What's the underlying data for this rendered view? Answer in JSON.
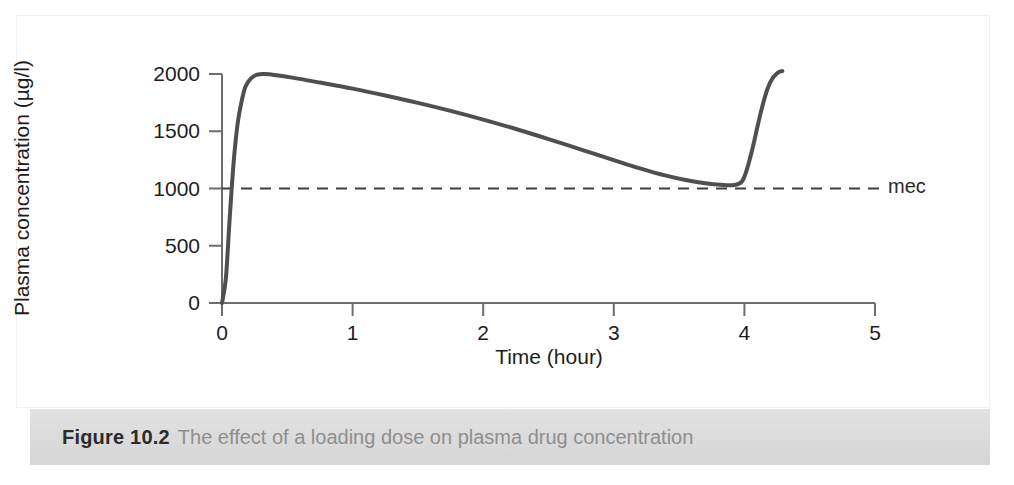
{
  "figure": {
    "caption_number": "Figure 10.2",
    "caption_text": "The effect of a loading dose on plasma drug concentration"
  },
  "chart_data": {
    "type": "line",
    "title": "",
    "xlabel": "Time (hour)",
    "ylabel": "Plasma concentration (µg/l)",
    "xlim": [
      0,
      5
    ],
    "ylim": [
      0,
      2000
    ],
    "xticks": [
      "0",
      "1",
      "2",
      "3",
      "4",
      "5"
    ],
    "xtick_values": [
      0,
      1,
      2,
      3,
      4,
      5
    ],
    "yticks": [
      "0",
      "500",
      "1000",
      "1500",
      "2000"
    ],
    "ytick_values": [
      0,
      500,
      1000,
      1500,
      2000
    ],
    "grid": false,
    "legend": "none",
    "line_color": "#4f4f4f",
    "axis_color": "#6d6d6d",
    "annotations": [
      {
        "name": "mec",
        "label": "mec",
        "type": "horizontal-threshold-line",
        "value": 1000,
        "style": "dashed",
        "color": "#3d3d3d",
        "x_start": 0,
        "x_end": 5.0
      }
    ],
    "series": [
      {
        "name": "plasma concentration",
        "points": [
          [
            0.0,
            0
          ],
          [
            0.03,
            220
          ],
          [
            0.06,
            760
          ],
          [
            0.09,
            1240
          ],
          [
            0.12,
            1570
          ],
          [
            0.15,
            1760
          ],
          [
            0.18,
            1890
          ],
          [
            0.22,
            1960
          ],
          [
            0.27,
            1995
          ],
          [
            0.33,
            2000
          ],
          [
            0.4,
            1992
          ],
          [
            0.55,
            1966
          ],
          [
            0.75,
            1925
          ],
          [
            1.0,
            1872
          ],
          [
            1.25,
            1812
          ],
          [
            1.5,
            1748
          ],
          [
            1.75,
            1678
          ],
          [
            2.0,
            1602
          ],
          [
            2.25,
            1520
          ],
          [
            2.5,
            1432
          ],
          [
            2.75,
            1340
          ],
          [
            3.0,
            1248
          ],
          [
            3.2,
            1176
          ],
          [
            3.4,
            1112
          ],
          [
            3.55,
            1074
          ],
          [
            3.7,
            1046
          ],
          [
            3.82,
            1032
          ],
          [
            3.92,
            1030
          ],
          [
            3.98,
            1060
          ],
          [
            4.02,
            1170
          ],
          [
            4.06,
            1340
          ],
          [
            4.1,
            1540
          ],
          [
            4.14,
            1730
          ],
          [
            4.18,
            1880
          ],
          [
            4.22,
            1970
          ],
          [
            4.26,
            2015
          ],
          [
            4.29,
            2025
          ]
        ]
      }
    ]
  }
}
